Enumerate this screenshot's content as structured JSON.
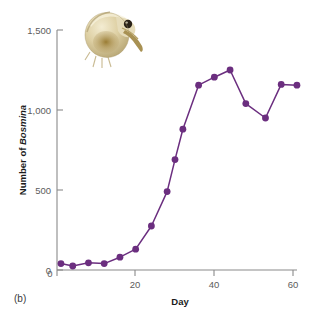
{
  "figure": {
    "panel_label": "(b)",
    "accent_color": "#6B2E7F",
    "axis_color": "#8a8a8a",
    "tick_label_color": "#5c5c5c"
  },
  "photo": {
    "name": "bosmina-water-flea-photo",
    "alt": "Photograph of a Bosmina water flea",
    "body_color": "#d9cba0",
    "shell_highlight": "#efe6c8",
    "gut_color": "#8e7433",
    "eye_color": "#2a2218",
    "antenna_color": "#9d8a55"
  },
  "chart_data": {
    "type": "line",
    "title": "",
    "xlabel": "Day",
    "ylabel_plain": "Number of ",
    "ylabel_italic": "Bosmina",
    "xlim": [
      0,
      62
    ],
    "ylim": [
      0,
      1500
    ],
    "grid": false,
    "legend": null,
    "xticks": [
      0,
      20,
      40,
      60
    ],
    "xticklabels": [
      "0",
      "20",
      "40",
      "60"
    ],
    "yticks": [
      0,
      500,
      1000,
      1500
    ],
    "yticklabels": [
      "0",
      "500",
      "1,000",
      "1,500"
    ],
    "series": [
      {
        "name": "Bosmina abundance",
        "color": "#6B2E7F",
        "marker": "circle",
        "x": [
          1,
          4,
          8,
          12,
          16,
          20,
          24,
          28,
          30,
          32,
          36,
          40,
          44,
          48,
          53,
          57,
          61
        ],
        "values": [
          40,
          25,
          45,
          40,
          80,
          130,
          275,
          490,
          690,
          880,
          1155,
          1205,
          1250,
          1040,
          950,
          1160,
          1155
        ]
      }
    ]
  }
}
